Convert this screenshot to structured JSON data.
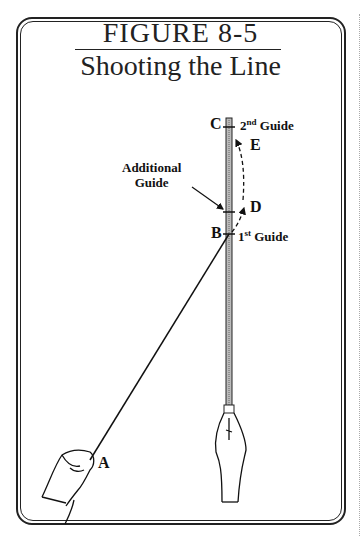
{
  "figure": {
    "number": "FIGURE 8-5",
    "title": "Shooting the Line"
  },
  "labels": {
    "a": "A",
    "b": "B",
    "c": "C",
    "d": "D",
    "e": "E",
    "first_guide_num": "1",
    "first_guide_sup": "st",
    "first_guide_word": "Guide",
    "second_guide_num": "2",
    "second_guide_sup": "nd",
    "second_guide_word": "Guide",
    "additional_line1": "Additional",
    "additional_line2": "Guide"
  }
}
